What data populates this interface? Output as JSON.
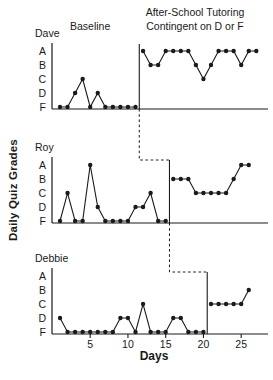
{
  "figure": {
    "ylabel": "Daily Quiz Grades",
    "xlabel": "Days",
    "baseline_label": "Baseline",
    "title_line1": "After-School Tutoring",
    "title_line2": "Contingent on D or F"
  },
  "chart_data": {
    "type": "line",
    "design": "multiple-baseline across subjects",
    "title": "After-School Tutoring Contingent on D or F",
    "xlabel": "Days",
    "ylabel": "Daily Quiz Grades",
    "grade_scale": [
      "A",
      "B",
      "C",
      "D",
      "F"
    ],
    "x_ticks": [
      5,
      10,
      15,
      20,
      25
    ],
    "x_range": [
      1,
      27
    ],
    "phases": [
      "Baseline",
      "After-School Tutoring Contingent on D or F"
    ],
    "colors": {
      "line": "#1a1a1a",
      "background": "#ffffff"
    },
    "subjects": [
      {
        "name": "Dave",
        "phase_change_after_day": 11,
        "baseline": {
          "start_day": 1,
          "grades": [
            "F",
            "F",
            "D",
            "C",
            "F",
            "D",
            "F",
            "F",
            "F",
            "F",
            "F"
          ]
        },
        "treatment": {
          "start_day": 12,
          "grades": [
            "A",
            "B",
            "B",
            "A",
            "A",
            "A",
            "A",
            "B",
            "C",
            "B",
            "A",
            "A",
            "A",
            "B",
            "A",
            "A"
          ]
        }
      },
      {
        "name": "Roy",
        "phase_change_after_day": 15,
        "baseline": {
          "start_day": 1,
          "grades": [
            "F",
            "C",
            "F",
            "F",
            "A",
            "D",
            "F",
            "F",
            "F",
            "F",
            "D",
            "D",
            "C",
            "F",
            "F"
          ]
        },
        "treatment": {
          "start_day": 16,
          "grades": [
            "B",
            "B",
            "B",
            "C",
            "C",
            "C",
            "C",
            "C",
            "B",
            "A",
            "A"
          ]
        }
      },
      {
        "name": "Debbie",
        "phase_change_after_day": 20,
        "baseline": {
          "start_day": 1,
          "grades": [
            "D",
            "F",
            "F",
            "F",
            "F",
            "F",
            "F",
            "F",
            "D",
            "D",
            "F",
            "C",
            "F",
            "F",
            "F",
            "D",
            "D",
            "F",
            "F",
            "F"
          ]
        },
        "treatment": {
          "start_day": 21,
          "grades": [
            "C",
            "C",
            "C",
            "C",
            "C",
            "B"
          ]
        }
      }
    ]
  }
}
